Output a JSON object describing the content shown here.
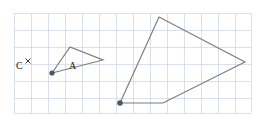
{
  "figure": {
    "title": "",
    "background_color": "#ffffff",
    "grid": {
      "visible": true,
      "color": "#c9d4e4",
      "spacing_px": 17,
      "x_start": 14,
      "y_start": 13,
      "x_end": 251,
      "y_end": 113
    },
    "stroke_color": "#7b7b7b",
    "dot_color": "#555555",
    "labels": {
      "shape_a": "A",
      "point_c": "C",
      "point_c_marker": "×"
    },
    "shapes": [
      {
        "name": "shape-a",
        "label": "A",
        "type": "polygon",
        "closed": true,
        "points": "52,73 70,47 103,60 52,73",
        "center_of_rotation": "52,73"
      },
      {
        "name": "shape-a-image",
        "label": "",
        "type": "polygon",
        "closed": true,
        "points": "120,103 159,17 245,62 163,103 120,103",
        "center_of_rotation": "120,103"
      }
    ],
    "vertex_dots": [
      {
        "name": "dot-shape-a",
        "cx": 52,
        "cy": 73,
        "r": 2.6
      },
      {
        "name": "dot-shape-a-image",
        "cx": 120,
        "cy": 103,
        "r": 2.8
      }
    ],
    "point_c": {
      "x": 18,
      "y": 62,
      "cross_x": 28,
      "cross_y": 62
    }
  }
}
